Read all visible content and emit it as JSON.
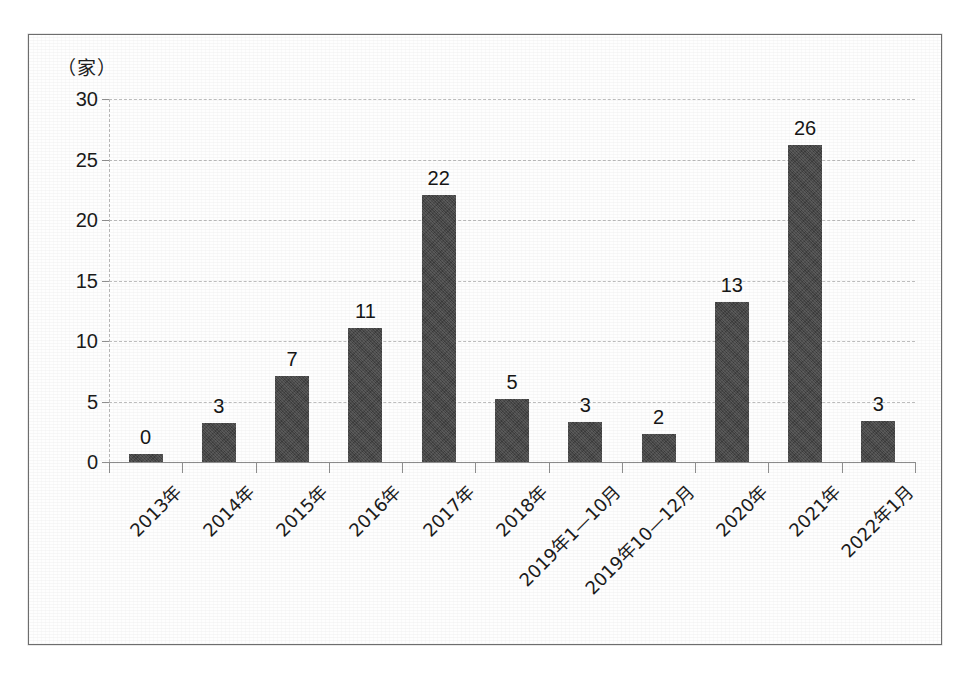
{
  "figure": {
    "unit_label": "（家）",
    "frame": true
  },
  "chart_data": {
    "type": "bar",
    "title": "",
    "subtitle": "",
    "xlabel": "",
    "ylabel": "（家）",
    "ylim": [
      0,
      30
    ],
    "ytick_values": [
      0,
      5,
      10,
      15,
      20,
      25,
      30
    ],
    "ytick_labels": [
      "0",
      "5",
      "10",
      "15",
      "20",
      "25",
      "30"
    ],
    "grid": true,
    "legend": "none",
    "bar_color": "#484848",
    "gridline_color": "#bdbdbd",
    "axis_color": "#8f8f8f",
    "categories": [
      "2013年",
      "2014年",
      "2015年",
      "2016年",
      "2017年",
      "2018年",
      "2019年1—10月",
      "2019年10—12月",
      "2020年",
      "2021年",
      "2022年1月"
    ],
    "values": [
      0,
      3,
      7,
      11,
      22,
      5,
      3,
      2,
      13,
      26,
      3
    ],
    "data_labels": [
      "0",
      "3",
      "7",
      "11",
      "22",
      "5",
      "3",
      "2",
      "13",
      "26",
      "3"
    ],
    "drawn_heights": [
      0.7,
      3.2,
      7.1,
      11.1,
      22.1,
      5.2,
      3.3,
      2.3,
      13.2,
      26.2,
      3.4
    ]
  }
}
